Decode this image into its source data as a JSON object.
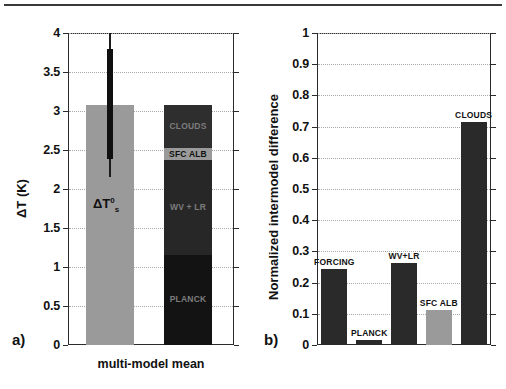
{
  "figure": {
    "panel_a": {
      "label": "a)",
      "ylabel": "ΔT (K)",
      "xlabel": "multi-model mean",
      "yticks": [
        "0",
        "0.5",
        "1",
        "1.5",
        "2",
        "2.5",
        "3",
        "3.5",
        "4"
      ],
      "annotation": {
        "base": "ΔT",
        "sup": "0",
        "sub": "s"
      }
    },
    "panel_b": {
      "label": "b)",
      "ylabel": "Normalized intermodel difference",
      "yticks": [
        "0",
        "0.1",
        "0.2",
        "0.3",
        "0.4",
        "0.5",
        "0.6",
        "0.7",
        "0.8",
        "0.9",
        "1"
      ]
    }
  },
  "chart_data": [
    {
      "type": "bar",
      "title": "",
      "panel": "a)",
      "xlabel": "multi-model mean",
      "ylabel": "ΔT (K)",
      "ylim": [
        0,
        4
      ],
      "yticks": [
        0,
        0.5,
        1,
        1.5,
        2,
        2.5,
        3,
        3.5,
        4
      ],
      "grid": true,
      "legend": "none",
      "categories": [
        "total warming",
        "feedback decomposition"
      ],
      "bars": [
        {
          "name": "ΔT_s^0",
          "label": "ΔT",
          "value": 3.08,
          "color": "#9a9a9a",
          "error_bar": {
            "low": 2.15,
            "high": 4.0,
            "box_low": 2.38,
            "box_high": 3.8
          }
        },
        {
          "name": "stacked contributions",
          "value": 3.08,
          "color": "#2a2a2a",
          "stack": [
            {
              "label": "PLANCK",
              "from": 0.0,
              "to": 1.15,
              "color": "#131313"
            },
            {
              "label": "WV + LR",
              "from": 1.15,
              "to": 2.37,
              "color": "#272727"
            },
            {
              "label": "SFC ALB",
              "from": 2.37,
              "to": 2.52,
              "color": "#9a9a9a"
            },
            {
              "label": "CLOUDS",
              "from": 2.52,
              "to": 3.08,
              "color": "#2e2e2e"
            }
          ]
        }
      ]
    },
    {
      "type": "bar",
      "title": "",
      "panel": "b)",
      "xlabel": "",
      "ylabel": "Normalized intermodel difference",
      "ylim": [
        0,
        1
      ],
      "yticks": [
        0,
        0.1,
        0.2,
        0.3,
        0.4,
        0.5,
        0.6,
        0.7,
        0.8,
        0.9,
        1
      ],
      "grid": true,
      "legend": "none",
      "categories": [
        "FORCING",
        "PLANCK",
        "WV+LR",
        "SFC ALB",
        "CLOUDS"
      ],
      "values": [
        0.245,
        0.017,
        0.262,
        0.113,
        0.715
      ],
      "colors": [
        "#2a2a2a",
        "#2a2a2a",
        "#2a2a2a",
        "#9a9a9a",
        "#2a2a2a"
      ]
    }
  ]
}
